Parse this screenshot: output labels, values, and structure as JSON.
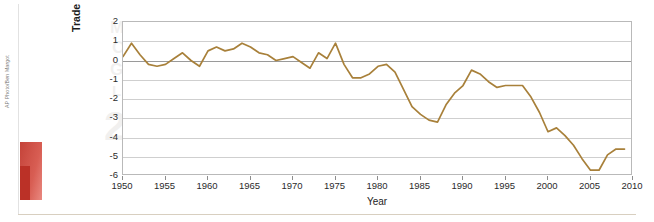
{
  "figure": {
    "photo_credit": "AP Photo/Ben Margot",
    "photo_alt": "american-flag-photo"
  },
  "watermark": {
    "l1": "MORE",
    "l2": "OPEC",
    "l3": "GAS",
    "l4": "LINE",
    "l5": "23"
  },
  "chart_data": {
    "type": "line",
    "title": "",
    "xlabel": "Year",
    "ylabel": "Trade Deficit as a Percent of GDP",
    "xlim": [
      1950,
      2010
    ],
    "ylim": [
      -6,
      2
    ],
    "xticks": [
      1950,
      1955,
      1960,
      1965,
      1970,
      1975,
      1980,
      1985,
      1990,
      1995,
      2000,
      2005,
      2010
    ],
    "yticks": [
      2,
      1,
      0,
      -1,
      -2,
      -3,
      -4,
      -5,
      -6
    ],
    "ytick_labels": [
      "2",
      "1",
      "0",
      "-1",
      "-2",
      "-3",
      "-4",
      "-5",
      "-6"
    ],
    "grid": true,
    "legend": "none",
    "line_color": "#a8803a",
    "x": [
      1950,
      1951,
      1952,
      1953,
      1954,
      1955,
      1956,
      1957,
      1958,
      1959,
      1960,
      1961,
      1962,
      1963,
      1964,
      1965,
      1966,
      1967,
      1968,
      1969,
      1970,
      1971,
      1972,
      1973,
      1974,
      1975,
      1976,
      1977,
      1978,
      1979,
      1980,
      1981,
      1982,
      1983,
      1984,
      1985,
      1986,
      1987,
      1988,
      1989,
      1990,
      1991,
      1992,
      1993,
      1994,
      1995,
      1996,
      1997,
      1998,
      1999,
      2000,
      2001,
      2002,
      2003,
      2004,
      2005,
      2006,
      2007,
      2008,
      2009
    ],
    "values": [
      0.2,
      0.9,
      0.3,
      -0.2,
      -0.3,
      -0.2,
      0.1,
      0.4,
      0.0,
      -0.3,
      0.5,
      0.7,
      0.5,
      0.6,
      0.9,
      0.7,
      0.4,
      0.3,
      0.0,
      0.1,
      0.2,
      -0.1,
      -0.4,
      0.4,
      0.1,
      0.9,
      -0.2,
      -0.9,
      -0.9,
      -0.7,
      -0.3,
      -0.2,
      -0.6,
      -1.5,
      -2.4,
      -2.8,
      -3.1,
      -3.2,
      -2.3,
      -1.7,
      -1.3,
      -0.5,
      -0.7,
      -1.1,
      -1.4,
      -1.3,
      -1.3,
      -1.3,
      -1.9,
      -2.7,
      -3.7,
      -3.5,
      -3.9,
      -4.4,
      -5.1,
      -5.7,
      -5.7,
      -4.9,
      -4.6,
      -4.6
    ]
  }
}
